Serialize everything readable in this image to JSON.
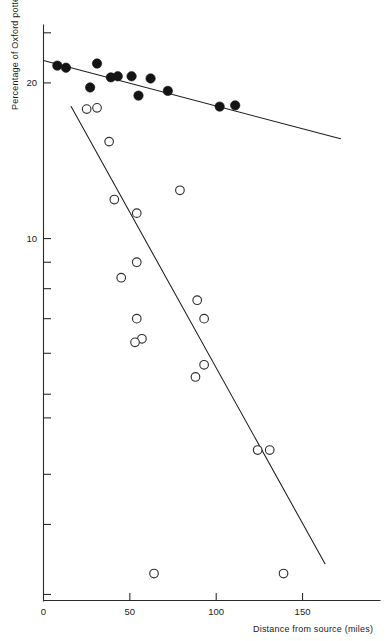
{
  "chart_data": {
    "type": "scatter",
    "title": "",
    "xlabel": "Distance from source (miles)",
    "ylabel": "Percentage of Oxford pottery",
    "xlim": [
      0,
      195
    ],
    "ylim_log": [
      2.0,
      26.0
    ],
    "yscale": "log",
    "grid": false,
    "legend": "none",
    "xticks": [
      {
        "value": 0,
        "label": "0"
      },
      {
        "value": 50,
        "label": "50"
      },
      {
        "value": 100,
        "label": "100"
      },
      {
        "value": 150,
        "label": "150"
      }
    ],
    "yticks": [
      {
        "value": 25,
        "label": ""
      },
      {
        "value": 20,
        "label": "20"
      },
      {
        "value": 10,
        "label": "10"
      },
      {
        "value": 9,
        "label": ""
      },
      {
        "value": 8,
        "label": ""
      },
      {
        "value": 7,
        "label": ""
      },
      {
        "value": 6,
        "label": ""
      },
      {
        "value": 5,
        "label": ""
      },
      {
        "value": 4.5,
        "label": ""
      },
      {
        "value": 3.5,
        "label": ""
      },
      {
        "value": 2.8,
        "label": ""
      },
      {
        "value": 2.05,
        "label": ""
      }
    ],
    "series": [
      {
        "name": "Filled circles",
        "marker": "filled-circle",
        "color": "#141414",
        "points": [
          {
            "x": 8,
            "y": 21.6
          },
          {
            "x": 13,
            "y": 21.4
          },
          {
            "x": 31,
            "y": 21.8
          },
          {
            "x": 27,
            "y": 19.6
          },
          {
            "x": 43,
            "y": 20.6
          },
          {
            "x": 39,
            "y": 20.5
          },
          {
            "x": 51,
            "y": 20.6
          },
          {
            "x": 62,
            "y": 20.4
          },
          {
            "x": 55,
            "y": 18.9
          },
          {
            "x": 72,
            "y": 19.3
          },
          {
            "x": 102,
            "y": 18.0
          },
          {
            "x": 111,
            "y": 18.1
          }
        ]
      },
      {
        "name": "Open circles",
        "marker": "open-circle",
        "color": "#303030",
        "points": [
          {
            "x": 25,
            "y": 17.8
          },
          {
            "x": 31,
            "y": 17.9
          },
          {
            "x": 38,
            "y": 15.4
          },
          {
            "x": 41,
            "y": 11.9
          },
          {
            "x": 54,
            "y": 11.2
          },
          {
            "x": 79,
            "y": 12.4
          },
          {
            "x": 54,
            "y": 9.0
          },
          {
            "x": 45,
            "y": 8.4
          },
          {
            "x": 54,
            "y": 7.0
          },
          {
            "x": 57,
            "y": 6.4
          },
          {
            "x": 53,
            "y": 6.3
          },
          {
            "x": 89,
            "y": 7.6
          },
          {
            "x": 93,
            "y": 7.0
          },
          {
            "x": 93,
            "y": 5.7
          },
          {
            "x": 88,
            "y": 5.4
          },
          {
            "x": 124,
            "y": 3.9
          },
          {
            "x": 131,
            "y": 3.9
          },
          {
            "x": 64,
            "y": 2.25
          },
          {
            "x": 139,
            "y": 2.25
          }
        ]
      }
    ],
    "fit_lines": [
      {
        "name": "Filled-circle regression",
        "x_start": 0,
        "y_start": 22.1,
        "x_end": 172,
        "y_end": 15.6
      },
      {
        "name": "Open-circle regression",
        "x_start": 16,
        "y_start": 18.0,
        "x_end": 163,
        "y_end": 2.35
      }
    ]
  }
}
